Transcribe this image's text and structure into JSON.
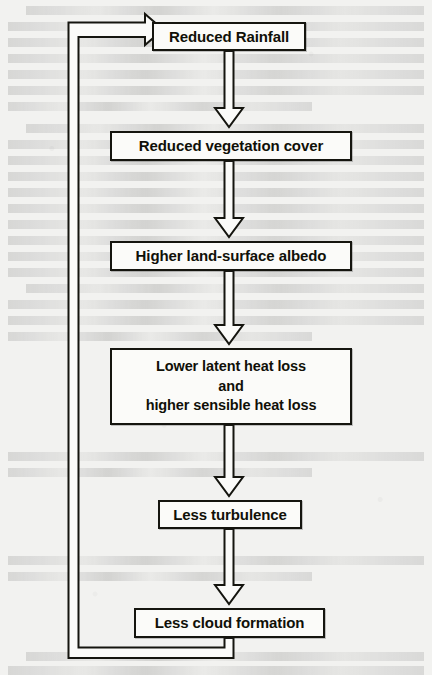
{
  "figure": {
    "type": "flowchart",
    "orientation": "vertical-with-feedback",
    "background_color": "#f2f2f0",
    "line_color": "#15150f",
    "box_fill_color": "#fbfbf9"
  },
  "nodes": [
    {
      "id": "reduced-rainfall",
      "label": "Reduced Rainfall",
      "x": 152,
      "y": 22,
      "w": 154,
      "h": 29,
      "font_size": 15,
      "multiline": false
    },
    {
      "id": "reduced-vegetation-cover",
      "label": "Reduced vegetation cover",
      "x": 110,
      "y": 131,
      "w": 242,
      "h": 30,
      "font_size": 15,
      "multiline": false
    },
    {
      "id": "higher-land-surface-albedo",
      "label": "Higher land-surface albedo",
      "x": 110,
      "y": 241,
      "w": 242,
      "h": 30,
      "font_size": 15,
      "multiline": false
    },
    {
      "id": "lower-latent-heat-loss",
      "label": "Lower latent heat loss\nand\nhigher sensible heat loss",
      "x": 110,
      "y": 348,
      "w": 242,
      "h": 77,
      "font_size": 15,
      "multiline": true
    },
    {
      "id": "less-turbulence",
      "label": "Less turbulence",
      "x": 158,
      "y": 500,
      "w": 144,
      "h": 29,
      "font_size": 15,
      "multiline": false
    },
    {
      "id": "less-cloud-formation",
      "label": "Less cloud formation",
      "x": 134,
      "y": 608,
      "w": 191,
      "h": 30,
      "font_size": 15,
      "multiline": false
    }
  ],
  "edges": [
    {
      "id": "edge-rainfall-to-vegetation",
      "from": "reduced-rainfall",
      "to": "reduced-vegetation-cover",
      "style": "hollow-block-arrow",
      "direction": "down"
    },
    {
      "id": "edge-vegetation-to-albedo",
      "from": "reduced-vegetation-cover",
      "to": "higher-land-surface-albedo",
      "style": "hollow-block-arrow",
      "direction": "down"
    },
    {
      "id": "edge-albedo-to-heatloss",
      "from": "higher-land-surface-albedo",
      "to": "lower-latent-heat-loss",
      "style": "hollow-block-arrow",
      "direction": "down"
    },
    {
      "id": "edge-heatloss-to-turbulence",
      "from": "lower-latent-heat-loss",
      "to": "less-turbulence",
      "style": "hollow-block-arrow",
      "direction": "down"
    },
    {
      "id": "edge-turbulence-to-cloud",
      "from": "less-turbulence",
      "to": "less-cloud-formation",
      "style": "hollow-block-arrow",
      "direction": "down"
    },
    {
      "id": "edge-feedback-cloud-to-rainfall",
      "from": "less-cloud-formation",
      "to": "reduced-rainfall",
      "style": "hollow-block-arrow",
      "direction": "feedback-left-up-right"
    }
  ],
  "ghost_text": {
    "description": "faint show-through of printed text from the underlying scanned page",
    "visible": true
  }
}
